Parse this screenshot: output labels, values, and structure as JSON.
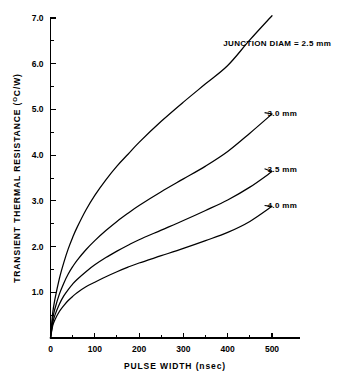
{
  "chart_data": {
    "type": "line",
    "title": "",
    "xlabel": "PULSE WIDTH (nsec)",
    "ylabel": "TRANSIENT THERMAL RESISTANCE ( C/W)",
    "ylabel_prefix": "TRANSIENT THERMAL RESISTANCE (",
    "ylabel_superscript": "O",
    "ylabel_suffix": "C/W)",
    "xlim": [
      0,
      550
    ],
    "ylim": [
      0,
      7.3
    ],
    "grid": false,
    "legend": "inline-annotations",
    "x_ticks": [
      0,
      100,
      200,
      300,
      400,
      500
    ],
    "x_tick_labels": [
      "0",
      "100",
      "200",
      "300",
      "400",
      "500"
    ],
    "x_minor_ticks": [
      50,
      150,
      250,
      350,
      450
    ],
    "y_ticks": [
      1.0,
      2.0,
      3.0,
      4.0,
      5.0,
      6.0,
      7.0
    ],
    "y_tick_labels": [
      "1.0",
      "2.0",
      "3.0",
      "4.0",
      "5.0",
      "6.0",
      "7.0"
    ],
    "y_minor_ticks": [
      0.5,
      1.5,
      2.5,
      3.5,
      4.5,
      5.5,
      6.5
    ],
    "x": [
      0,
      5,
      10,
      20,
      30,
      40,
      50,
      60,
      80,
      100,
      125,
      150,
      175,
      200,
      250,
      300,
      350,
      400,
      450,
      500
    ],
    "series": [
      {
        "name": "2.5 mm",
        "label": "JUNCTION DIAM = 2.5 mm",
        "values": [
          0,
          0.55,
          0.85,
          1.3,
          1.65,
          1.95,
          2.2,
          2.42,
          2.8,
          3.12,
          3.46,
          3.76,
          4.02,
          4.28,
          4.74,
          5.16,
          5.56,
          5.96,
          6.52,
          7.05
        ]
      },
      {
        "name": "3.0 mm",
        "label": "3.0 mm",
        "values": [
          0,
          0.42,
          0.64,
          0.96,
          1.2,
          1.4,
          1.56,
          1.7,
          1.93,
          2.13,
          2.35,
          2.55,
          2.73,
          2.9,
          3.2,
          3.48,
          3.76,
          4.08,
          4.48,
          4.9
        ]
      },
      {
        "name": "3.5 mm",
        "label": "3.5 mm",
        "values": [
          0,
          0.33,
          0.5,
          0.74,
          0.92,
          1.06,
          1.18,
          1.28,
          1.45,
          1.6,
          1.76,
          1.9,
          2.03,
          2.15,
          2.36,
          2.57,
          2.79,
          3.02,
          3.3,
          3.64
        ]
      },
      {
        "name": "4.0 mm",
        "label": "4.0 mm",
        "values": [
          0,
          0.27,
          0.4,
          0.58,
          0.71,
          0.82,
          0.91,
          0.99,
          1.12,
          1.22,
          1.34,
          1.45,
          1.55,
          1.64,
          1.8,
          1.96,
          2.13,
          2.31,
          2.55,
          2.88
        ]
      }
    ],
    "annotations": [
      {
        "text": "JUNCTION DIAM = 2.5 mm",
        "x": 390,
        "y": 6.45
      },
      {
        "text": "3.0 mm",
        "x": 490,
        "y": 4.93
      },
      {
        "text": "3.5 mm",
        "x": 490,
        "y": 3.7
      },
      {
        "text": "4.0 mm",
        "x": 490,
        "y": 2.9
      }
    ],
    "colors": {
      "curve": "#000000",
      "axis": "#000000",
      "background": "#ffffff"
    }
  }
}
